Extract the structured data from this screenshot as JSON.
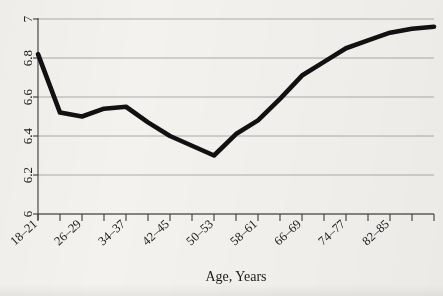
{
  "chart_data": {
    "type": "line",
    "title": "",
    "xlabel": "Age, Years",
    "ylabel": "",
    "grid": true,
    "legend": "none",
    "xlim": [
      0,
      18
    ],
    "ylim": [
      6,
      7
    ],
    "ytick_labels": [
      "7",
      "6.8",
      "6.6",
      "6.4",
      "6.2",
      "6"
    ],
    "ytick_values": [
      7,
      6.8,
      6.6,
      6.4,
      6.2,
      6
    ],
    "xtick_labels": [
      "18–21",
      "26–29",
      "34–37",
      "42–45",
      "50–53",
      "58–61",
      "66–69",
      "74–77",
      "82–85"
    ],
    "xtick_label_positions": [
      0,
      2,
      4,
      6,
      8,
      10,
      12,
      14,
      16
    ],
    "minor_tick_count": 19,
    "x": [
      0,
      1,
      2,
      3,
      4,
      5,
      6,
      7,
      8,
      9,
      10,
      11,
      12,
      13,
      14,
      15,
      16,
      17,
      18
    ],
    "categories": [
      "18–21",
      "22–25",
      "26–29",
      "30–33",
      "34–37",
      "38–41",
      "42–45",
      "46–49",
      "50–53",
      "54–57",
      "58–61",
      "62–65",
      "66–69",
      "70–73",
      "74–77",
      "78–81",
      "82–85",
      "",
      ""
    ],
    "values": [
      6.82,
      6.52,
      6.5,
      6.54,
      6.55,
      6.47,
      6.4,
      6.35,
      6.3,
      6.41,
      6.48,
      6.59,
      6.71,
      6.78,
      6.85,
      6.89,
      6.93,
      6.95,
      6.96
    ],
    "series": [
      {
        "name": "value",
        "values": [
          6.82,
          6.52,
          6.5,
          6.54,
          6.55,
          6.47,
          6.4,
          6.35,
          6.3,
          6.41,
          6.48,
          6.59,
          6.71,
          6.78,
          6.85,
          6.89,
          6.93,
          6.95,
          6.96
        ]
      }
    ],
    "line_color": "#111111",
    "grid_color": "#9a9a9a",
    "axis_color": "#3b3b3b",
    "background_color": "#f4f2ef"
  }
}
